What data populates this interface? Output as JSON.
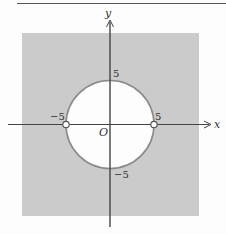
{
  "figure": {
    "colors": {
      "background": "#fdfdfd",
      "shaded_region": "#cbcbcb",
      "circle_interior": "#fdfdfd",
      "circle_stroke": "#8a8a8a",
      "axis": "#444444",
      "top_rule": "#555555"
    },
    "axes": {
      "x_label": "x",
      "y_label": "y",
      "origin_label": "O"
    },
    "ticks": {
      "x_neg": "−5",
      "x_pos": "5",
      "y_pos": "5",
      "y_neg": "−5"
    },
    "circle": {
      "center": [
        0,
        0
      ],
      "radius": 5
    },
    "open_points": [
      {
        "x": -5,
        "y": 0
      },
      {
        "x": 5,
        "y": 0
      }
    ]
  }
}
